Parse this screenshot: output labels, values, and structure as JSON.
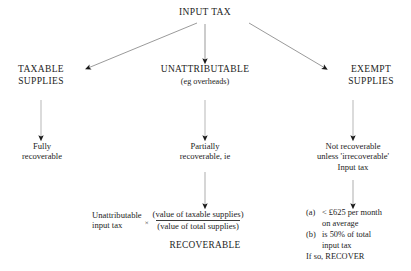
{
  "diagram": {
    "title": "INPUT TAX",
    "type": "flowchart",
    "top_clipped_fragment": "· · · · · · · · · ·",
    "nodes": {
      "root": {
        "id": "input-tax",
        "label": "INPUT TAX"
      },
      "taxable_supplies": {
        "id": "taxable-supplies",
        "label": "TAXABLE\nSUPPLIES"
      },
      "unattributable": {
        "id": "unattributable",
        "label": "UNATTRIBUTABLE",
        "sublabel": "(eg overheads)"
      },
      "exempt_supplies": {
        "id": "exempt-supplies",
        "label": "EXEMPT\nSUPPLIES"
      },
      "fully_recoverable": {
        "id": "fully-recoverable",
        "label": "Fully\nrecoverable"
      },
      "partially_recoverable": {
        "id": "partially-recoverable",
        "label": "Partially\nrecoverable, ie"
      },
      "not_recoverable": {
        "id": "not-recoverable",
        "label": "Not recoverable\nunless 'irrecoverable'\nInput tax"
      },
      "formula": {
        "id": "apportionment-formula",
        "left_term": "Unattributable\ninput tax",
        "operator": "×",
        "numerator": "(value of taxable supplies)",
        "denominator": "(value of total supplies)"
      },
      "recoverable": {
        "id": "recoverable",
        "label": "RECOVERABLE"
      },
      "conditions": {
        "id": "de-minimis-conditions",
        "items": [
          {
            "marker": "(a)",
            "text": "< £625 per month\non average"
          },
          {
            "marker": "(b)",
            "text": "is 50% of total\ninput tax"
          }
        ],
        "conclusion": "If so, RECOVER"
      }
    },
    "edges": [
      {
        "from": "input-tax",
        "to": "taxable-supplies",
        "style": "arrow"
      },
      {
        "from": "input-tax",
        "to": "unattributable",
        "style": "arrow"
      },
      {
        "from": "input-tax",
        "to": "exempt-supplies",
        "style": "arrow"
      },
      {
        "from": "taxable-supplies",
        "to": "fully-recoverable",
        "style": "arrow"
      },
      {
        "from": "unattributable",
        "to": "partially-recoverable",
        "style": "arrow"
      },
      {
        "from": "exempt-supplies",
        "to": "not-recoverable",
        "style": "arrow"
      },
      {
        "from": "partially-recoverable",
        "to": "apportionment-formula",
        "style": "arrow"
      },
      {
        "from": "not-recoverable",
        "to": "de-minimis-conditions",
        "style": "arrow"
      }
    ],
    "colors": {
      "background": "#ffffff",
      "text": "#1d1d1d",
      "connector": "#6e6e6e",
      "arrowhead": "#1a1a1a"
    }
  }
}
